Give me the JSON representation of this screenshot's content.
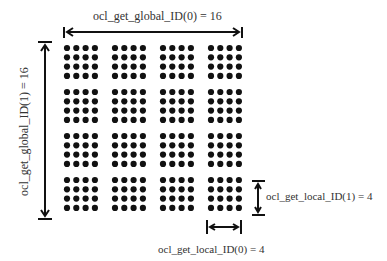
{
  "labels": {
    "global_x": "ocl_get_global_ID(0) = 16",
    "global_y": "ocl_get_global_ID(1) = 16",
    "local_y": "ocl_get_local_ID(1) = 4",
    "local_x": "ocl_get_local_ID(0) = 4"
  },
  "grid": {
    "blocks_x": 4,
    "blocks_y": 4,
    "items_per_block_x": 4,
    "items_per_block_y": 4,
    "dot_color": "#111111"
  }
}
